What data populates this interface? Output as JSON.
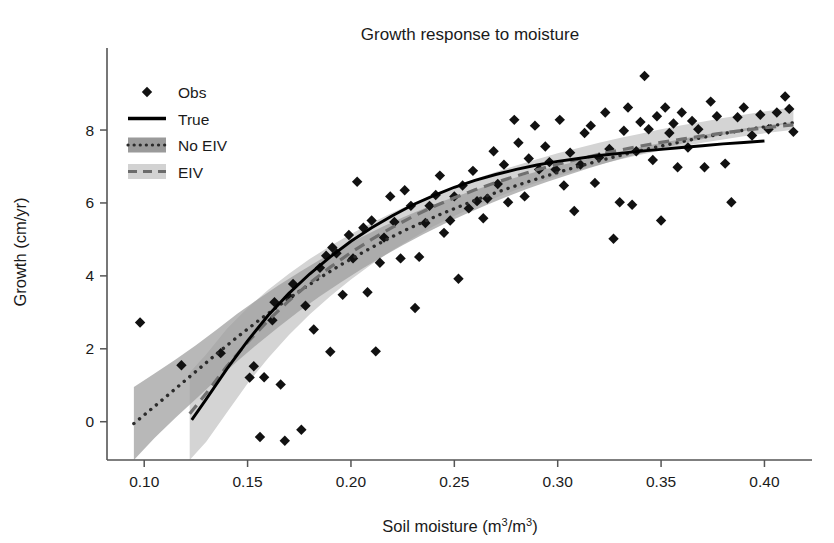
{
  "chart_data": {
    "type": "scatter",
    "title": "Growth response to moisture",
    "xlabel": "Soil moisture (m3/m3)",
    "xlabel_parts": {
      "pre": "Soil moisture (m",
      "sup1": "3",
      "mid": "/m",
      "sup2": "3",
      "post": ")"
    },
    "ylabel": "Growth (cm/yr)",
    "xlim": [
      0.082,
      0.423
    ],
    "ylim": [
      -1.05,
      10.25
    ],
    "xticks": [
      0.1,
      0.15,
      0.2,
      0.25,
      0.3,
      0.35,
      0.4
    ],
    "xticklabels": [
      "0.10",
      "0.15",
      "0.20",
      "0.25",
      "0.30",
      "0.35",
      "0.40"
    ],
    "yticks": [
      0,
      2,
      4,
      6,
      8
    ],
    "yticklabels": [
      "0",
      "2",
      "4",
      "6",
      "8"
    ],
    "grid": false,
    "legend_position": "upper left",
    "legend": [
      {
        "label": "Obs",
        "marker": "diamond",
        "color": "#111111"
      },
      {
        "label": "True",
        "style": "solid",
        "color": "#000000"
      },
      {
        "label": "No EIV",
        "style": "dotted",
        "color": "#2b2b2b",
        "band_color": "#9a9a9a"
      },
      {
        "label": "EIV",
        "style": "dashed",
        "color": "#6b6b6b",
        "band_color": "#d2d2d2"
      }
    ],
    "colors": {
      "observation": "#111111",
      "true_line": "#000000",
      "noeiv_line": "#2b2b2b",
      "eiv_line": "#707070",
      "noeiv_band": "#9d9d9d",
      "eiv_band": "#d4d4d4",
      "axis": "#555555",
      "background": "#ffffff"
    },
    "series": [
      {
        "name": "Obs",
        "type": "scatter",
        "x": [
          0.098,
          0.118,
          0.137,
          0.151,
          0.153,
          0.156,
          0.158,
          0.162,
          0.163,
          0.166,
          0.168,
          0.17,
          0.172,
          0.176,
          0.178,
          0.182,
          0.185,
          0.188,
          0.19,
          0.191,
          0.193,
          0.196,
          0.199,
          0.201,
          0.203,
          0.206,
          0.208,
          0.21,
          0.212,
          0.214,
          0.216,
          0.219,
          0.221,
          0.224,
          0.226,
          0.229,
          0.231,
          0.233,
          0.236,
          0.238,
          0.241,
          0.243,
          0.245,
          0.248,
          0.25,
          0.252,
          0.254,
          0.257,
          0.259,
          0.261,
          0.264,
          0.266,
          0.269,
          0.271,
          0.274,
          0.276,
          0.279,
          0.281,
          0.284,
          0.286,
          0.289,
          0.291,
          0.294,
          0.296,
          0.299,
          0.301,
          0.303,
          0.306,
          0.308,
          0.311,
          0.313,
          0.316,
          0.318,
          0.32,
          0.323,
          0.325,
          0.327,
          0.33,
          0.332,
          0.334,
          0.336,
          0.338,
          0.34,
          0.342,
          0.344,
          0.346,
          0.348,
          0.35,
          0.352,
          0.354,
          0.356,
          0.358,
          0.36,
          0.363,
          0.365,
          0.368,
          0.371,
          0.374,
          0.377,
          0.381,
          0.384,
          0.387,
          0.39,
          0.394,
          0.398,
          0.402,
          0.406,
          0.41,
          0.412,
          0.414
        ],
        "y": [
          2.72,
          1.55,
          1.88,
          1.21,
          1.52,
          -0.42,
          1.22,
          2.78,
          3.28,
          1.02,
          -0.52,
          3.42,
          3.78,
          -0.22,
          3.18,
          2.53,
          4.22,
          4.55,
          1.92,
          4.78,
          4.62,
          3.48,
          5.12,
          4.48,
          6.58,
          5.32,
          3.55,
          5.52,
          1.93,
          4.36,
          5.05,
          6.18,
          5.48,
          4.48,
          6.35,
          5.92,
          3.12,
          4.52,
          5.45,
          5.92,
          6.22,
          6.75,
          5.18,
          5.52,
          6.18,
          3.92,
          6.48,
          5.85,
          6.88,
          6.05,
          5.58,
          6.12,
          7.42,
          6.52,
          7.05,
          6.02,
          8.28,
          7.65,
          6.18,
          7.22,
          8.12,
          6.92,
          7.55,
          7.12,
          6.92,
          8.28,
          6.48,
          7.38,
          5.78,
          7.05,
          7.92,
          8.12,
          6.55,
          7.25,
          8.48,
          7.48,
          5.02,
          6.02,
          7.98,
          8.62,
          5.95,
          7.42,
          8.22,
          9.48,
          8.02,
          7.18,
          8.38,
          5.52,
          8.62,
          7.92,
          8.18,
          6.98,
          8.48,
          7.52,
          8.25,
          8.02,
          6.98,
          8.78,
          8.38,
          7.08,
          6.02,
          8.35,
          8.62,
          7.85,
          8.42,
          8.02,
          8.48,
          8.92,
          8.58,
          7.95
        ]
      },
      {
        "name": "True",
        "type": "line",
        "style": "solid",
        "x": [
          0.123,
          0.13,
          0.14,
          0.15,
          0.16,
          0.17,
          0.18,
          0.19,
          0.2,
          0.21,
          0.22,
          0.23,
          0.24,
          0.25,
          0.26,
          0.27,
          0.28,
          0.29,
          0.3,
          0.31,
          0.32,
          0.33,
          0.34,
          0.35,
          0.36,
          0.37,
          0.38,
          0.39,
          0.4
        ],
        "y": [
          0.05,
          0.62,
          1.45,
          2.22,
          2.92,
          3.52,
          4.05,
          4.52,
          4.95,
          5.32,
          5.65,
          5.95,
          6.2,
          6.43,
          6.62,
          6.78,
          6.92,
          7.04,
          7.14,
          7.22,
          7.3,
          7.36,
          7.42,
          7.47,
          7.52,
          7.57,
          7.62,
          7.66,
          7.7
        ]
      },
      {
        "name": "No EIV",
        "type": "line",
        "style": "dotted",
        "x": [
          0.095,
          0.105,
          0.115,
          0.125,
          0.135,
          0.145,
          0.155,
          0.165,
          0.175,
          0.185,
          0.195,
          0.205,
          0.215,
          0.225,
          0.235,
          0.245,
          0.255,
          0.265,
          0.275,
          0.285,
          0.295,
          0.305,
          0.315,
          0.325,
          0.335,
          0.345,
          0.355,
          0.365,
          0.375,
          0.385,
          0.395,
          0.405,
          0.414
        ],
        "y": [
          -0.05,
          0.42,
          0.9,
          1.38,
          1.86,
          2.32,
          2.76,
          3.18,
          3.58,
          3.95,
          4.3,
          4.62,
          4.93,
          5.22,
          5.48,
          5.73,
          5.96,
          6.18,
          6.38,
          6.57,
          6.75,
          6.92,
          7.08,
          7.23,
          7.37,
          7.5,
          7.62,
          7.74,
          7.85,
          7.95,
          8.04,
          8.13,
          8.2
        ],
        "band_lower": [
          -1.05,
          -0.45,
          0.1,
          0.62,
          1.15,
          1.66,
          2.14,
          2.6,
          3.04,
          3.44,
          3.82,
          4.18,
          4.52,
          4.84,
          5.14,
          5.42,
          5.68,
          5.93,
          6.16,
          6.38,
          6.58,
          6.77,
          6.95,
          7.12,
          7.28,
          7.42,
          7.56,
          7.69,
          7.81,
          7.92,
          8.02,
          8.12,
          8.2
        ],
        "band_upper": [
          0.95,
          1.32,
          1.7,
          2.1,
          2.52,
          2.96,
          3.36,
          3.74,
          4.1,
          4.44,
          4.76,
          5.06,
          5.34,
          5.6,
          5.84,
          6.06,
          6.26,
          6.45,
          6.62,
          6.78,
          6.94,
          7.08,
          7.22,
          7.35,
          7.47,
          7.59,
          7.7,
          7.81,
          7.91,
          8.0,
          8.08,
          8.16,
          8.22
        ]
      },
      {
        "name": "EIV",
        "type": "line",
        "style": "dashed",
        "x": [
          0.122,
          0.13,
          0.14,
          0.15,
          0.16,
          0.17,
          0.18,
          0.19,
          0.2,
          0.21,
          0.22,
          0.23,
          0.24,
          0.25,
          0.26,
          0.27,
          0.28,
          0.29,
          0.3,
          0.31,
          0.32,
          0.33,
          0.34,
          0.35,
          0.36,
          0.37,
          0.38,
          0.39,
          0.4,
          0.41,
          0.414
        ],
        "y": [
          0.22,
          0.78,
          1.52,
          2.18,
          2.78,
          3.32,
          3.8,
          4.24,
          4.64,
          5.0,
          5.33,
          5.63,
          5.9,
          6.14,
          6.36,
          6.56,
          6.74,
          6.91,
          7.06,
          7.2,
          7.33,
          7.45,
          7.56,
          7.66,
          7.75,
          7.84,
          7.92,
          7.99,
          8.06,
          8.12,
          8.14
        ],
        "band_lower": [
          -1.05,
          -0.55,
          0.25,
          1.05,
          1.75,
          2.38,
          2.94,
          3.44,
          3.9,
          4.32,
          4.7,
          5.04,
          5.36,
          5.64,
          5.9,
          6.14,
          6.36,
          6.56,
          6.74,
          6.9,
          7.05,
          7.19,
          7.32,
          7.44,
          7.55,
          7.65,
          7.74,
          7.83,
          7.91,
          7.98,
          8.01
        ],
        "band_upper": [
          1.35,
          1.85,
          2.55,
          3.12,
          3.62,
          4.06,
          4.46,
          4.82,
          5.15,
          5.45,
          5.73,
          5.99,
          6.23,
          6.45,
          6.66,
          6.85,
          7.03,
          7.2,
          7.36,
          7.51,
          7.65,
          7.78,
          7.9,
          8.02,
          8.13,
          8.23,
          8.33,
          8.42,
          8.51,
          8.59,
          8.62
        ]
      }
    ]
  }
}
